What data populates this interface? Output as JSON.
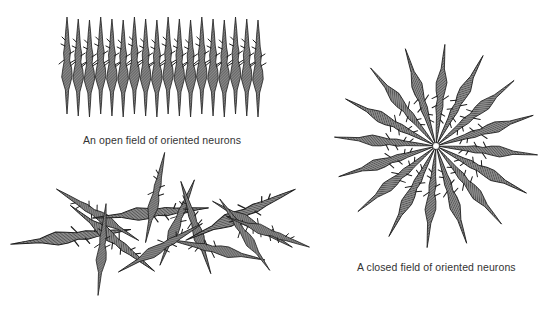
{
  "figure": {
    "panels": [
      {
        "id": "open-field",
        "caption": "An open field of oriented neurons",
        "neuron_count": 18,
        "arrangement": "parallel vertical row"
      },
      {
        "id": "closed-field",
        "caption": "A closed field of oriented neurons",
        "neuron_count": 16,
        "arrangement": "radial star, somas pointing outward"
      },
      {
        "id": "random-field",
        "caption": "",
        "neuron_count": 14,
        "arrangement": "randomly oriented, overlapping"
      }
    ],
    "colors": {
      "neuron_fill": "#6e6e6e",
      "neuron_stroke": "#1e1e1e",
      "background": "#ffffff",
      "text": "#333333"
    }
  }
}
